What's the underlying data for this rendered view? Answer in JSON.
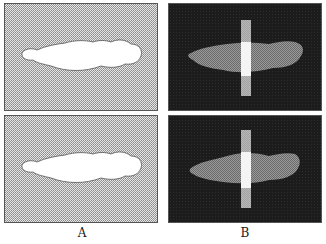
{
  "figure": {
    "panels": [
      {
        "id": "A-top",
        "column": "A",
        "row": 1,
        "style": "stippled-light-background-with-white-silhouette"
      },
      {
        "id": "B-top",
        "column": "B",
        "row": 1,
        "style": "dark-background-with-grey-textured-shape-and-white-bar"
      },
      {
        "id": "A-bottom",
        "column": "A",
        "row": 2,
        "style": "stippled-light-background-with-white-silhouette"
      },
      {
        "id": "B-bottom",
        "column": "B",
        "row": 2,
        "style": "dark-background-with-grey-textured-shape-and-white-bar"
      }
    ],
    "labels": {
      "left": "A",
      "right": "B"
    },
    "colors": {
      "stipple_bg": "#c8c8c8",
      "dark_bg": "#1e1e1e",
      "shape_grey": "#7a7a7a",
      "bar": "#f2f2f2"
    }
  }
}
